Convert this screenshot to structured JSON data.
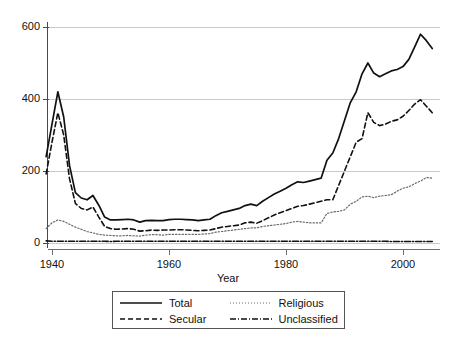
{
  "chart_data": {
    "type": "line",
    "title": "",
    "xlabel": "Year",
    "ylabel": "",
    "xlim": [
      1939,
      2006
    ],
    "ylim": [
      0,
      620
    ],
    "grid": true,
    "legend_position": "bottom",
    "x_ticks": [
      "1940",
      "1960",
      "1980",
      "2000"
    ],
    "x_tick_values": [
      1940,
      1960,
      1980,
      2000
    ],
    "y_ticks": [
      "0",
      "200",
      "400",
      "600"
    ],
    "y_tick_values": [
      0,
      200,
      400,
      600
    ],
    "x": [
      1939,
      1940,
      1941,
      1942,
      1943,
      1944,
      1945,
      1946,
      1947,
      1948,
      1949,
      1950,
      1951,
      1952,
      1953,
      1954,
      1955,
      1956,
      1957,
      1958,
      1959,
      1960,
      1961,
      1962,
      1963,
      1964,
      1965,
      1966,
      1967,
      1968,
      1969,
      1970,
      1971,
      1972,
      1973,
      1974,
      1975,
      1976,
      1977,
      1978,
      1979,
      1980,
      1981,
      1982,
      1983,
      1984,
      1985,
      1986,
      1987,
      1988,
      1989,
      1990,
      1991,
      1992,
      1993,
      1994,
      1995,
      1996,
      1997,
      1998,
      1999,
      2000,
      2001,
      2002,
      2003,
      2004,
      2005
    ],
    "series": [
      {
        "name": "Total",
        "style": "solid",
        "color": "#111111",
        "values": [
          240,
          330,
          420,
          350,
          215,
          140,
          125,
          120,
          132,
          105,
          72,
          64,
          64,
          65,
          66,
          64,
          58,
          62,
          63,
          62,
          62,
          65,
          66,
          66,
          65,
          64,
          62,
          64,
          66,
          76,
          84,
          88,
          92,
          96,
          104,
          108,
          104,
          116,
          126,
          136,
          144,
          152,
          162,
          170,
          168,
          172,
          176,
          180,
          230,
          250,
          290,
          340,
          390,
          420,
          470,
          500,
          472,
          462,
          470,
          478,
          482,
          490,
          510,
          545,
          580,
          562,
          540
        ]
      },
      {
        "name": "Secular",
        "style": "dashed",
        "color": "#111111",
        "values": [
          192,
          280,
          362,
          300,
          178,
          110,
          96,
          92,
          100,
          72,
          46,
          40,
          38,
          39,
          40,
          38,
          33,
          34,
          36,
          35,
          36,
          36,
          37,
          37,
          36,
          35,
          34,
          35,
          36,
          40,
          44,
          46,
          48,
          50,
          56,
          58,
          55,
          62,
          70,
          78,
          84,
          90,
          96,
          102,
          104,
          108,
          112,
          116,
          120,
          120,
          160,
          200,
          240,
          280,
          290,
          362,
          335,
          326,
          330,
          338,
          342,
          352,
          368,
          386,
          398,
          380,
          362
        ]
      },
      {
        "name": "Religious",
        "style": "dotted",
        "color": "#6b6b6b",
        "values": [
          40,
          56,
          64,
          60,
          52,
          44,
          38,
          32,
          28,
          24,
          22,
          21,
          20,
          20,
          21,
          20,
          19,
          22,
          23,
          23,
          22,
          24,
          24,
          24,
          24,
          24,
          24,
          25,
          26,
          30,
          32,
          34,
          36,
          38,
          40,
          42,
          42,
          46,
          48,
          50,
          52,
          54,
          58,
          60,
          58,
          56,
          56,
          56,
          82,
          86,
          88,
          92,
          108,
          116,
          128,
          130,
          126,
          130,
          132,
          134,
          144,
          152,
          156,
          165,
          172,
          182,
          180
        ]
      },
      {
        "name": "Unclassified",
        "style": "dashdot",
        "color": "#111111",
        "values": [
          6,
          5,
          5,
          5,
          5,
          5,
          5,
          5,
          5,
          5,
          5,
          4,
          5,
          5,
          5,
          5,
          5,
          5,
          5,
          5,
          5,
          5,
          5,
          5,
          5,
          5,
          5,
          5,
          5,
          5,
          5,
          5,
          5,
          5,
          5,
          5,
          5,
          5,
          5,
          5,
          5,
          5,
          5,
          5,
          5,
          5,
          5,
          5,
          5,
          5,
          5,
          5,
          5,
          5,
          5,
          5,
          5,
          5,
          5,
          4,
          4,
          4,
          4,
          4,
          4,
          4,
          4
        ]
      }
    ]
  },
  "legend": {
    "entries": [
      {
        "label": "Total",
        "key": "solid-line-key"
      },
      {
        "label": "Religious",
        "key": "dotted-line-key"
      },
      {
        "label": "Secular",
        "key": "dashed-line-key"
      },
      {
        "label": "Unclassified",
        "key": "dashdot-line-key"
      }
    ]
  }
}
